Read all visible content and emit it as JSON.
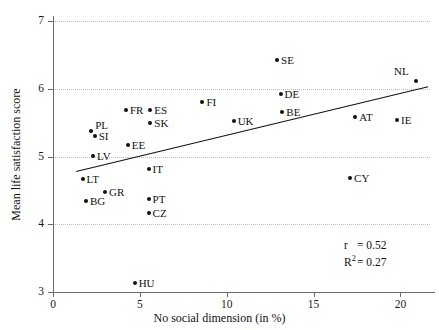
{
  "chart_data": {
    "type": "scatter",
    "title": "",
    "xlabel": "No social dimension (in %)",
    "ylabel": "Mean life satisfaction score",
    "xlim": [
      0,
      21.7
    ],
    "ylim": [
      3,
      7
    ],
    "xticks": [
      0,
      5,
      10,
      15,
      20
    ],
    "yticks": [
      3,
      4,
      5,
      6,
      7
    ],
    "xtick_labels": [
      "0",
      "5",
      "10",
      "15",
      "20"
    ],
    "ytick_labels": [
      "3",
      "4",
      "5",
      "6",
      "7"
    ],
    "grid": "horizontal-dotted",
    "legend": "none",
    "points": [
      {
        "label": "LT",
        "x": 1.7,
        "y": 4.67,
        "label_pos": "right"
      },
      {
        "label": "BG",
        "x": 1.9,
        "y": 4.35,
        "label_pos": "right"
      },
      {
        "label": "PL",
        "x": 2.2,
        "y": 5.38,
        "label_pos": "upright"
      },
      {
        "label": "SI",
        "x": 2.4,
        "y": 5.3,
        "label_pos": "right"
      },
      {
        "label": "LV",
        "x": 2.3,
        "y": 5.01,
        "label_pos": "right"
      },
      {
        "label": "GR",
        "x": 3.0,
        "y": 4.48,
        "label_pos": "right"
      },
      {
        "label": "FR",
        "x": 4.2,
        "y": 5.69,
        "label_pos": "right"
      },
      {
        "label": "EE",
        "x": 4.3,
        "y": 5.17,
        "label_pos": "right"
      },
      {
        "label": "HU",
        "x": 4.7,
        "y": 3.13,
        "label_pos": "right"
      },
      {
        "label": "IT",
        "x": 5.5,
        "y": 4.82,
        "label_pos": "right"
      },
      {
        "label": "PT",
        "x": 5.5,
        "y": 4.38,
        "label_pos": "right"
      },
      {
        "label": "CZ",
        "x": 5.5,
        "y": 4.16,
        "label_pos": "right"
      },
      {
        "label": "SK",
        "x": 5.6,
        "y": 5.49,
        "label_pos": "right"
      },
      {
        "label": "ES",
        "x": 5.6,
        "y": 5.69,
        "label_pos": "right"
      },
      {
        "label": "FI",
        "x": 8.6,
        "y": 5.8,
        "label_pos": "right"
      },
      {
        "label": "UK",
        "x": 10.4,
        "y": 5.52,
        "label_pos": "right"
      },
      {
        "label": "SE",
        "x": 12.9,
        "y": 6.42,
        "label_pos": "right"
      },
      {
        "label": "DE",
        "x": 13.1,
        "y": 5.92,
        "label_pos": "right"
      },
      {
        "label": "BE",
        "x": 13.2,
        "y": 5.66,
        "label_pos": "right"
      },
      {
        "label": "CY",
        "x": 17.1,
        "y": 4.69,
        "label_pos": "right"
      },
      {
        "label": "AT",
        "x": 17.4,
        "y": 5.58,
        "label_pos": "right"
      },
      {
        "label": "IE",
        "x": 19.8,
        "y": 5.54,
        "label_pos": "right"
      },
      {
        "label": "NL",
        "x": 20.9,
        "y": 6.12,
        "label_pos": "upleft"
      }
    ],
    "trendline": {
      "x_start": 1.35,
      "y_start": 4.79,
      "x_end": 21.6,
      "y_end": 6.04
    },
    "annotations": {
      "r_symbol": "r",
      "r_value": "= 0.52",
      "r2_symbol": "R2",
      "r2_value": "= 0.27",
      "r_text": "r  = 0.52",
      "r2_text": "R² = 0.27"
    }
  }
}
